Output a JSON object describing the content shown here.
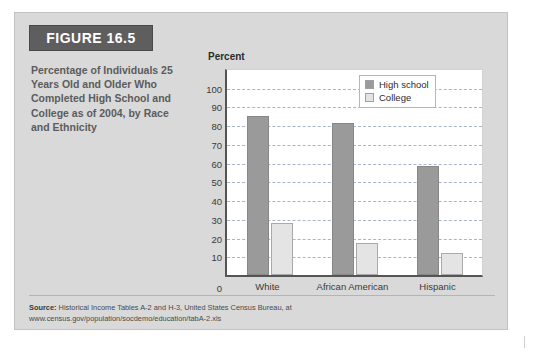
{
  "figure": {
    "banner_label": "FIGURE 16.5",
    "caption": "Percentage of Individuals 25 Years Old and Older Who Completed High School and College as of 2004, by Race and Ethnicity"
  },
  "source": {
    "label": "Source:",
    "text": " Historical Income Tables A-2 and H-3, United States Census Bureau, at",
    "url": "www.census.gov/population/socdemo/education/tabA-2.xls"
  },
  "legend": {
    "items": [
      {
        "label": "High school",
        "color": "#9a9a9a"
      },
      {
        "label": "College",
        "color": "#e4e4e4"
      }
    ]
  },
  "chart_data": {
    "type": "bar",
    "title": "",
    "xlabel": "",
    "ylabel": "Percent",
    "ylim": [
      0,
      110
    ],
    "yticks": [
      0,
      10,
      20,
      30,
      40,
      50,
      60,
      70,
      80,
      90,
      100
    ],
    "grid": true,
    "legend_position": "top-right",
    "categories": [
      "White",
      "African American",
      "Hispanic"
    ],
    "series": [
      {
        "name": "High school",
        "color": "#9a9a9a",
        "values": [
          85,
          81,
          58
        ]
      },
      {
        "name": "College",
        "color": "#e4e4e4",
        "values": [
          28,
          17,
          12
        ]
      }
    ]
  }
}
